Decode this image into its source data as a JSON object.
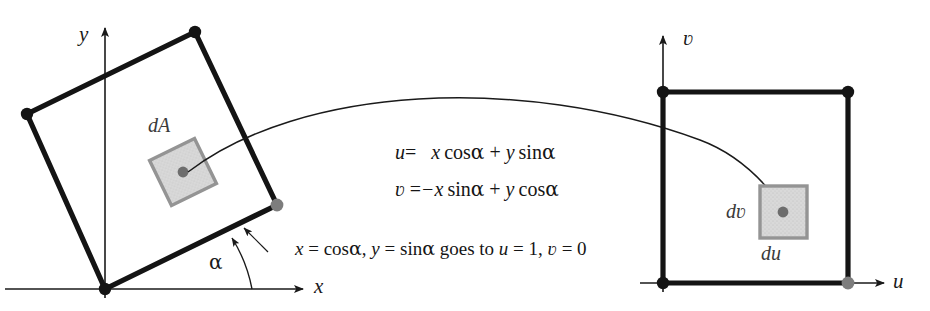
{
  "figure": {
    "type": "math-diagram",
    "background_color": "#ffffff",
    "ink_color": "#1a1a1a",
    "accent_gray": "#808080",
    "shade_fill": "#d4d4d4"
  },
  "left_plot": {
    "name": "xy-plane",
    "axis_x_label": "x",
    "axis_y_label": "y",
    "angle_label": "α",
    "region_label": "dA",
    "square_corners": [
      {
        "x": 105,
        "y": 289,
        "marker": "black"
      },
      {
        "x": 27,
        "y": 114,
        "marker": "black"
      },
      {
        "x": 195,
        "y": 32,
        "marker": "black"
      },
      {
        "x": 277,
        "y": 205,
        "marker": "gray"
      }
    ],
    "element_center": {
      "x": 183,
      "y": 172
    },
    "rotation_degrees": 25
  },
  "right_plot": {
    "name": "uv-plane",
    "axis_u_label": "u",
    "axis_v_label": "ʋ",
    "width_label": "du",
    "height_label": "dʋ",
    "square_corners": [
      {
        "x": 663,
        "y": 92,
        "marker": "black"
      },
      {
        "x": 848,
        "y": 92,
        "marker": "black"
      },
      {
        "x": 848,
        "y": 283,
        "marker": "gray"
      },
      {
        "x": 663,
        "y": 283,
        "marker": "black"
      }
    ],
    "element_center": {
      "x": 783,
      "y": 212
    }
  },
  "equations": {
    "line1": {
      "lhs": "u",
      "eq": "=",
      "rhs_terms": [
        "x",
        "cos",
        "α",
        "+",
        "y",
        "sin",
        "α"
      ],
      "plain": "u = x cos α + y sin α"
    },
    "line2": {
      "lhs": "ʋ",
      "eq": "=",
      "rhs_terms": [
        "−x",
        "sin",
        "α",
        "+",
        "y",
        "cos",
        "α"
      ],
      "plain": "ʋ = −x sin α + y cos α"
    }
  },
  "note": {
    "plain": "x = cos α, y = sin α goes to u = 1, ʋ = 0",
    "part1_var": "x",
    "part1_eq": "= cos",
    "part1_alpha": "α",
    "part2_sep": ",",
    "part2_var": "y",
    "part2_eq": "= sin",
    "part2_alpha": "α",
    "part3_text": "goes to",
    "part4_var": "u",
    "part4_val": "= 1,",
    "part5_var": "ʋ",
    "part5_val": "= 0"
  }
}
